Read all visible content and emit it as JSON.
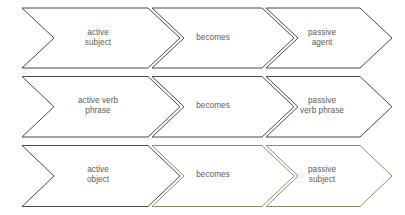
{
  "diagram": {
    "type": "chevron-process-flow",
    "background_color": "#ffffff",
    "stroke_color": "#4a4a4a",
    "tinted_stroke_color": "#8f8d6e",
    "text_color": "#5b5b5b",
    "rows": [
      {
        "row_name": "subject-transformation",
        "cells": [
          {
            "label": "active\nsubject",
            "role": "source"
          },
          {
            "label": "becomes",
            "role": "connector"
          },
          {
            "label": "passive\nagent",
            "role": "result"
          }
        ]
      },
      {
        "row_name": "verb-phrase-transformation",
        "cells": [
          {
            "label": "active verb\nphrase",
            "role": "source"
          },
          {
            "label": "becomes",
            "role": "connector"
          },
          {
            "label": "passive\nverb phrase",
            "role": "result"
          }
        ]
      },
      {
        "row_name": "object-transformation",
        "cells": [
          {
            "label": "active\nobject",
            "role": "source"
          },
          {
            "label": "becomes",
            "role": "connector"
          },
          {
            "label": "passive\nsubject",
            "role": "result"
          }
        ]
      }
    ],
    "geometry": {
      "rows_y": [
        {
          "top": 8,
          "bottom": 68
        },
        {
          "top": 76.5,
          "bottom": 137
        },
        {
          "top": 145.5,
          "bottom": 206.5
        }
      ],
      "columns_x": [
        {
          "left": 22,
          "body_right": 148,
          "tip": 180
        },
        {
          "left": 152,
          "body_right": 262,
          "tip": 294
        },
        {
          "left": 266,
          "body_right": 360,
          "tip": 392
        }
      ],
      "notch_depth": 32,
      "label_centers": [
        [
          98,
          38
        ],
        [
          213,
          38
        ],
        [
          322,
          38
        ],
        [
          98,
          106
        ],
        [
          213,
          106
        ],
        [
          322,
          106
        ],
        [
          98,
          175
        ],
        [
          213,
          175
        ],
        [
          322,
          175
        ]
      ],
      "tinted_cells": [
        [
          2,
          1
        ],
        [
          2,
          2
        ]
      ]
    }
  }
}
